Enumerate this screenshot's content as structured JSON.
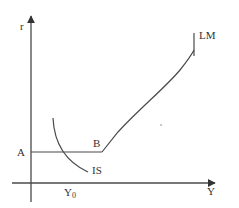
{
  "diagram": {
    "type": "IS-LM diagram",
    "axes": {
      "y_label": "r",
      "x_label": "Y"
    },
    "curves": {
      "lm_label": "LM",
      "is_label": "IS"
    },
    "points": {
      "a_label": "A",
      "b_label": "B",
      "y0_label": "Y",
      "y0_subscript": "0"
    },
    "colors": {
      "line": "#4a4a4a",
      "text": "#333333",
      "background": "#ffffff"
    }
  }
}
